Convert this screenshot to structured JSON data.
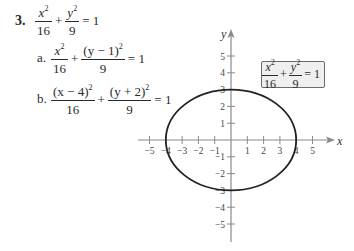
{
  "problem": {
    "number": "3.",
    "main_equation": {
      "term1": {
        "num_var": "x",
        "num_exp": "2",
        "den": "16"
      },
      "plus": "+",
      "term2": {
        "num_var": "y",
        "num_exp": "2",
        "den": "9"
      },
      "equals": "= 1"
    },
    "parts": [
      {
        "label": "a.",
        "term1": {
          "num": "x",
          "num_exp": "2",
          "den": "16"
        },
        "plus": "+",
        "term2": {
          "num": "(y − 1)",
          "num_exp": "2",
          "den": "9"
        },
        "equals": "= 1"
      },
      {
        "label": "b.",
        "term1": {
          "num": "(x − 4)",
          "num_exp": "2",
          "den": "16"
        },
        "plus": "+",
        "term2": {
          "num": "(y + 2)",
          "num_exp": "2",
          "den": "9"
        },
        "equals": "= 1"
      }
    ]
  },
  "graph": {
    "x_axis_label": "x",
    "y_axis_label": "y",
    "x_ticks": [
      "−5",
      "−4",
      "−3",
      "−2",
      "−1",
      "1",
      "2",
      "3",
      "4",
      "5"
    ],
    "y_ticks": [
      "5",
      "4",
      "3",
      "2",
      "1",
      "−1",
      "−2",
      "−3",
      "−4",
      "−5"
    ],
    "ellipse": {
      "center": [
        0,
        0
      ],
      "a": 4,
      "b": 3
    },
    "legend_box": {
      "term1": {
        "num_var": "x",
        "num_exp": "2",
        "den": "16"
      },
      "plus": "+",
      "term2": {
        "num_var": "y",
        "num_exp": "2",
        "den": "9"
      },
      "equals": "= 1"
    },
    "colors": {
      "axis": "#8a8a8a",
      "curve": "#222222",
      "box_bg": "#efefef",
      "box_border": "#6a6a6a"
    }
  }
}
